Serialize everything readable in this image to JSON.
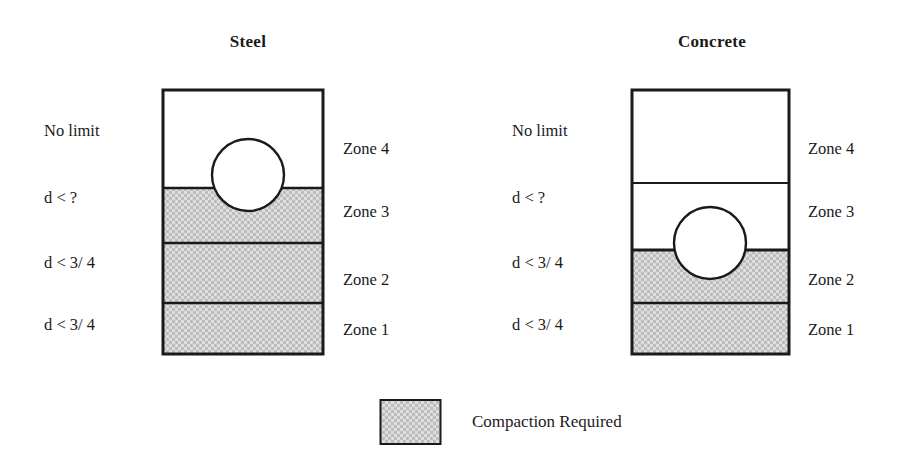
{
  "figure": {
    "background_color": "#ffffff",
    "line_color": "#1a1a1a",
    "hatch_color": "#c9c9c9"
  },
  "panels": [
    {
      "id": "steel",
      "title": "Steel",
      "left_labels": [
        "No limit",
        "d < ?",
        "d < 3/ 4",
        "d < 3/ 4"
      ],
      "right_labels": [
        "Zone 4",
        "Zone 3",
        "Zone 2",
        "Zone 1"
      ],
      "zones": [
        {
          "name": "Zone 4",
          "compaction": false
        },
        {
          "name": "Zone 3",
          "compaction": true
        },
        {
          "name": "Zone 2",
          "compaction": true
        },
        {
          "name": "Zone 1",
          "compaction": true
        }
      ]
    },
    {
      "id": "concrete",
      "title": "Concrete",
      "left_labels": [
        "No limit",
        "d < ?",
        "d < 3/ 4",
        "d < 3/ 4"
      ],
      "right_labels": [
        "Zone 4",
        "Zone 3",
        "Zone 2",
        "Zone 1"
      ],
      "zones": [
        {
          "name": "Zone 4",
          "compaction": false
        },
        {
          "name": "Zone 3",
          "compaction": false
        },
        {
          "name": "Zone 2",
          "compaction": true
        },
        {
          "name": "Zone 1",
          "compaction": true
        }
      ]
    }
  ],
  "legend": {
    "label": "Compaction Required"
  }
}
